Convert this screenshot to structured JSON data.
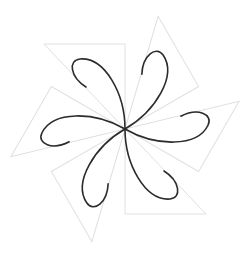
{
  "figure": {
    "center": [
      125,
      129
    ],
    "symmetry_order": 6,
    "rotation_step_deg": 60,
    "colors": {
      "background": "#ffffff",
      "triangle_stroke": "#e0e0e0",
      "curve_stroke": "#2b2b2b"
    },
    "triangle_local": [
      [
        0,
        0
      ],
      [
        -81,
        -85
      ],
      [
        0,
        -85
      ]
    ],
    "petal_local_path": "M 0 0 C 0 -35, -20 -72, -45 -70 C -57 -69, -55 -52, -39 -42",
    "stroke_widths": {
      "triangle": 1,
      "curve": 1.6
    }
  }
}
